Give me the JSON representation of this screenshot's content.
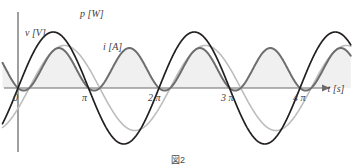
{
  "figure": {
    "caption": "図2",
    "axes": {
      "x_axis_label": "t [s]",
      "y_axis_origin_label": "0",
      "x_ticks": [
        {
          "label": "π",
          "x": 85
        },
        {
          "label": "2 π",
          "x": 155
        },
        {
          "label": "3 π",
          "x": 228
        },
        {
          "label": "4 π",
          "x": 300
        }
      ]
    },
    "curve_labels": {
      "voltage": "v [V]",
      "power": "p [W]",
      "current": "i [A]"
    },
    "colors": {
      "voltage": "#231f20",
      "power": "#6e6e6e",
      "current": "#bdbdbd",
      "axis": "#6b6b6b",
      "power_fill": "#f0f0f0",
      "text": "#3d3d3d"
    }
  },
  "chart_data": {
    "type": "line",
    "title": "",
    "xlabel": "t [s]",
    "ylabel": "",
    "xlim": [
      -0.25,
      4.8
    ],
    "ylim": [
      -1.35,
      1.35
    ],
    "x_unit": "pi radians",
    "grid": false,
    "legend": "inline-curve-labels",
    "x_tick_values": [
      0,
      1,
      2,
      3,
      4
    ],
    "x_tick_labels": [
      "0",
      "π",
      "2 π",
      "3 π",
      "4 π"
    ],
    "series": [
      {
        "name": "v [V]",
        "equation": "v = 1.00 * sin(t)",
        "amplitude": 1.0,
        "phase_deg": 0,
        "frequency_mult": 1,
        "color": "#231f20",
        "style": "solid",
        "width": 1.6,
        "label_pos": {
          "x": 0.42,
          "y": 0.82
        }
      },
      {
        "name": "i [A]",
        "equation": "i = 0.76 * sin(t - 0.50)",
        "amplitude": 0.76,
        "phase_deg": -28.6,
        "frequency_mult": 1,
        "color": "#bdbdbd",
        "style": "solid",
        "width": 1.6,
        "label_pos": {
          "x": 1.52,
          "y": 0.52
        }
      },
      {
        "name": "p [W]",
        "equation": "p = v * i = 0.38 * [cos(0.50) - cos(2t - 0.50)]",
        "amplitude": 0.76,
        "offset": 0.334,
        "frequency_mult": 2,
        "color": "#6e6e6e",
        "style": "solid-filled",
        "width": 2.0,
        "fill": "#f0f0f0",
        "label_pos": {
          "x": 1.02,
          "y": 1.18
        }
      }
    ]
  }
}
